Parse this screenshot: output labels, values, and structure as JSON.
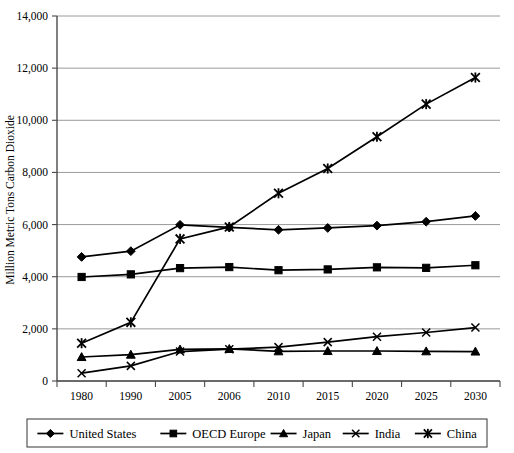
{
  "chart_data": {
    "type": "line",
    "title": "",
    "xlabel": "",
    "ylabel": "Million Metric Tons Carbon Dioxide",
    "categories": [
      "1980",
      "1990",
      "2005",
      "2006",
      "2010",
      "2015",
      "2020",
      "2025",
      "2030"
    ],
    "ylim": [
      0,
      14000
    ],
    "yticks": [
      0,
      2000,
      4000,
      6000,
      8000,
      10000,
      12000,
      14000
    ],
    "ytick_labels": [
      "0",
      "2,000",
      "4,000",
      "6,000",
      "8,000",
      "10,000",
      "12,000",
      "14,000"
    ],
    "grid": true,
    "legend_position": "bottom",
    "series": [
      {
        "name": "United States",
        "marker": "diamond",
        "color": "#000000",
        "values": [
          4760,
          4980,
          5990,
          5890,
          5800,
          5870,
          5960,
          6110,
          6330
        ]
      },
      {
        "name": "OECD Europe",
        "marker": "square",
        "color": "#000000",
        "values": [
          3990,
          4090,
          4330,
          4370,
          4250,
          4280,
          4360,
          4340,
          4440
        ]
      },
      {
        "name": "Japan",
        "marker": "triangle",
        "color": "#000000",
        "values": [
          920,
          1010,
          1210,
          1230,
          1140,
          1150,
          1150,
          1140,
          1130
        ]
      },
      {
        "name": "India",
        "marker": "x",
        "color": "#000000",
        "values": [
          300,
          580,
          1130,
          1220,
          1300,
          1490,
          1700,
          1860,
          2050
        ]
      },
      {
        "name": "China",
        "marker": "star",
        "color": "#000000",
        "values": [
          1450,
          2250,
          5450,
          5910,
          7200,
          8150,
          9370,
          10620,
          11640
        ]
      }
    ]
  },
  "legend": {
    "items": [
      {
        "label": "United States",
        "marker": "diamond"
      },
      {
        "label": "OECD Europe",
        "marker": "square"
      },
      {
        "label": "Japan",
        "marker": "triangle"
      },
      {
        "label": "India",
        "marker": "x"
      },
      {
        "label": "China",
        "marker": "star"
      }
    ]
  }
}
